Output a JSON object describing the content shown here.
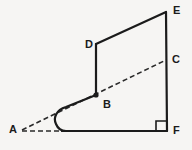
{
  "figure": {
    "type": "line-diagram",
    "canvas": {
      "width": 192,
      "height": 150
    },
    "background_color": "#f6f5f3",
    "stroke_color": "#1b1b1b",
    "solid_stroke_width": 2.2,
    "dashed_stroke_width": 1.6,
    "dash_pattern": "5,3",
    "vertices": [
      {
        "id": "A",
        "label": "A",
        "x": 22,
        "y": 130,
        "label_x": 9,
        "label_y": 124,
        "marked": false
      },
      {
        "id": "B",
        "label": "B",
        "x": 96,
        "y": 95,
        "label_x": 103,
        "label_y": 99,
        "marked": true
      },
      {
        "id": "C",
        "label": "C",
        "x": 166,
        "y": 60,
        "label_x": 172,
        "label_y": 54,
        "marked": false
      },
      {
        "id": "D",
        "label": "D",
        "x": 96,
        "y": 44,
        "label_x": 85,
        "label_y": 39,
        "marked": false
      },
      {
        "id": "E",
        "label": "E",
        "x": 166,
        "y": 12,
        "label_x": 173,
        "label_y": 5,
        "marked": false
      },
      {
        "id": "F",
        "label": "F",
        "x": 167,
        "y": 131,
        "label_x": 173,
        "label_y": 125,
        "marked": false
      }
    ],
    "solid_paths": {
      "outline": "M 96 44 L 166 12",
      "edge_de": "M 96 44 L 166 12",
      "edge_db": "M 96 44 L 96 95",
      "edge_ef": "M 166 12 L 167 131",
      "edge_bottom": "M 62 131 L 167 131",
      "hook_curve": "M 96 95 L 66 107 C 56 110 53 118 56 124 C 58 129 62 131 66 131 L 62 131"
    },
    "dashed_paths": {
      "line_abc": "M 22 130 L 166 60",
      "line_a_base": "M 22 131 L 63 131"
    },
    "right_angle_marker": {
      "at_vertex": "F",
      "path": "M 156 131 L 156 121 L 167 121",
      "size": 11
    },
    "vertex_dot": {
      "at_vertex": "B",
      "radius": 2.6
    }
  }
}
